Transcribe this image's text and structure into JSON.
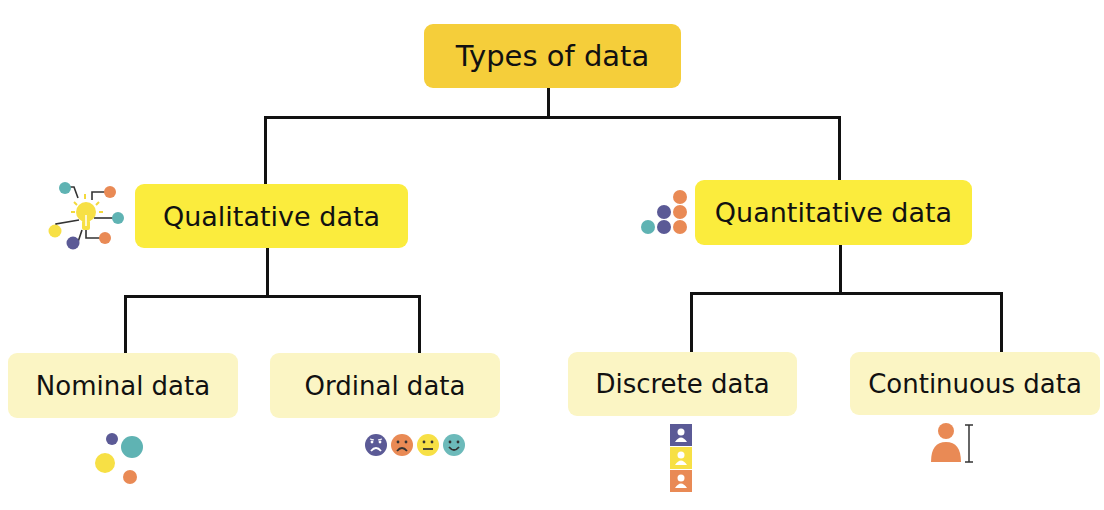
{
  "diagram": {
    "title": "Types of data",
    "root": {
      "label": "Types of data",
      "color": "#F5CE3A"
    },
    "branches": [
      {
        "label": "Qualitative data",
        "icon": "lightbulb-network-icon",
        "color": "#FBEC3D",
        "children": [
          {
            "label": "Nominal data",
            "icon": "scattered-dots-icon"
          },
          {
            "label": "Ordinal data",
            "icon": "emoji-faces-scale-icon"
          }
        ]
      },
      {
        "label": "Quantitative data",
        "icon": "stacked-dots-icon",
        "color": "#FBEC3D",
        "children": [
          {
            "label": "Discrete data",
            "icon": "stacked-people-blocks-icon"
          },
          {
            "label": "Continuous data",
            "icon": "person-height-icon"
          }
        ]
      }
    ],
    "leaf_color": "#FBF5C4",
    "palette": {
      "teal": "#5FB3B3",
      "orange": "#E98A55",
      "purple": "#5B5A96",
      "yellow": "#F7E045"
    }
  }
}
